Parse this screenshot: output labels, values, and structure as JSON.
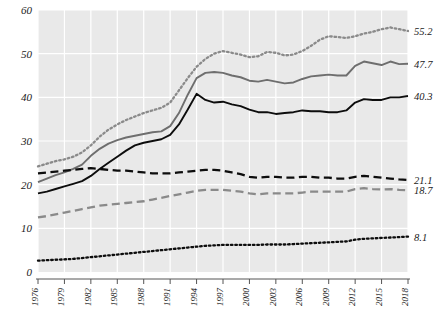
{
  "chart_data": {
    "type": "line",
    "title": "",
    "subtitle": "",
    "xlabel": "",
    "ylabel": "",
    "xlim": [
      1976,
      2018
    ],
    "ylim": [
      0,
      60
    ],
    "grid": true,
    "legend_position": "right-end-labels",
    "y_ticks": [
      0,
      10,
      20,
      30,
      40,
      50,
      60
    ],
    "y_tick_labels": [
      "0",
      "10",
      "20",
      "30",
      "40",
      "50",
      "60"
    ],
    "x_ticks": [
      1976,
      1979,
      1982,
      1985,
      1988,
      1991,
      1994,
      1997,
      2000,
      2003,
      2006,
      2009,
      2012,
      2015,
      2018
    ],
    "x_tick_labels": [
      "1976",
      "1979",
      "1982",
      "1985",
      "1988",
      "1991",
      "1994",
      "1997",
      "2000",
      "2003",
      "2006",
      "2009",
      "2012",
      "2015",
      "2018"
    ],
    "x": [
      1976,
      1977,
      1978,
      1979,
      1980,
      1981,
      1982,
      1983,
      1984,
      1985,
      1986,
      1987,
      1988,
      1989,
      1990,
      1991,
      1992,
      1993,
      1994,
      1995,
      1996,
      1997,
      1998,
      1999,
      2000,
      2001,
      2002,
      2003,
      2004,
      2005,
      2006,
      2007,
      2008,
      2009,
      2010,
      2011,
      2012,
      2013,
      2014,
      2015,
      2016,
      2017,
      2018
    ],
    "series": [
      {
        "name": "series-1",
        "style": "dotted",
        "color": "#8a8a8a",
        "end_label": "55.2",
        "end_value": 55.2,
        "values": [
          24.2,
          24.8,
          25.4,
          25.8,
          26.4,
          27.4,
          29.0,
          31.0,
          32.6,
          33.8,
          34.8,
          35.6,
          36.4,
          37.0,
          37.6,
          38.8,
          41.6,
          44.4,
          47.0,
          48.8,
          50.0,
          50.6,
          50.2,
          49.8,
          49.2,
          49.4,
          50.4,
          50.2,
          49.6,
          49.8,
          50.6,
          51.8,
          53.2,
          54.0,
          53.8,
          53.6,
          54.0,
          54.6,
          55.0,
          55.6,
          56.0,
          55.6,
          55.2
        ]
      },
      {
        "name": "series-2",
        "style": "solid",
        "color": "#6e6e6e",
        "end_label": "47.7",
        "end_value": 47.7,
        "values": [
          20.6,
          21.4,
          22.2,
          22.8,
          23.6,
          24.6,
          26.6,
          28.2,
          29.4,
          30.2,
          30.8,
          31.2,
          31.6,
          32.0,
          32.2,
          33.4,
          36.4,
          40.6,
          44.4,
          45.6,
          45.8,
          45.6,
          45.0,
          44.6,
          43.8,
          43.6,
          44.0,
          43.6,
          43.2,
          43.4,
          44.2,
          44.8,
          45.0,
          45.2,
          45.0,
          45.0,
          47.2,
          48.2,
          47.8,
          47.4,
          48.2,
          47.6,
          47.7
        ]
      },
      {
        "name": "series-3",
        "style": "solid",
        "color": "#0d0d0d",
        "end_label": "40.3",
        "end_value": 40.3,
        "values": [
          18.0,
          18.4,
          19.0,
          19.6,
          20.2,
          20.8,
          22.0,
          23.6,
          25.0,
          26.4,
          27.8,
          29.0,
          29.6,
          30.0,
          30.4,
          31.4,
          33.8,
          37.2,
          40.8,
          39.4,
          38.8,
          39.0,
          38.4,
          38.0,
          37.2,
          36.6,
          36.6,
          36.2,
          36.4,
          36.6,
          37.0,
          36.8,
          36.8,
          36.6,
          36.6,
          37.0,
          38.8,
          39.6,
          39.4,
          39.4,
          40.0,
          40.0,
          40.3
        ]
      },
      {
        "name": "series-4",
        "style": "dashed",
        "color": "#0d0d0d",
        "end_label": "21.1",
        "end_value": 21.1,
        "values": [
          22.6,
          22.8,
          23.0,
          23.2,
          23.4,
          23.6,
          23.8,
          23.6,
          23.4,
          23.2,
          23.2,
          23.0,
          22.8,
          22.6,
          22.6,
          22.6,
          22.8,
          23.0,
          23.2,
          23.4,
          23.4,
          23.2,
          22.8,
          22.4,
          21.8,
          21.6,
          21.8,
          21.8,
          21.6,
          21.6,
          21.8,
          21.8,
          21.6,
          21.6,
          21.4,
          21.4,
          21.8,
          22.0,
          21.8,
          21.6,
          21.4,
          21.2,
          21.1
        ]
      },
      {
        "name": "series-5",
        "style": "dashed",
        "color": "#8a8a8a",
        "end_label": "18.7",
        "end_value": 18.7,
        "values": [
          12.5,
          12.8,
          13.2,
          13.6,
          14.0,
          14.4,
          14.8,
          15.2,
          15.4,
          15.6,
          15.8,
          16.0,
          16.2,
          16.6,
          17.0,
          17.4,
          17.8,
          18.2,
          18.6,
          18.8,
          18.8,
          18.8,
          18.6,
          18.4,
          18.0,
          17.8,
          18.0,
          18.0,
          18.0,
          18.0,
          18.2,
          18.4,
          18.4,
          18.4,
          18.4,
          18.4,
          19.0,
          19.2,
          19.0,
          18.9,
          19.0,
          18.8,
          18.7
        ]
      },
      {
        "name": "series-6",
        "style": "dotted",
        "color": "#0d0d0d",
        "end_label": "8.1",
        "end_value": 8.1,
        "values": [
          2.6,
          2.7,
          2.8,
          2.9,
          3.0,
          3.2,
          3.4,
          3.6,
          3.8,
          4.0,
          4.2,
          4.4,
          4.6,
          4.8,
          5.0,
          5.2,
          5.4,
          5.6,
          5.8,
          6.0,
          6.1,
          6.2,
          6.2,
          6.2,
          6.2,
          6.2,
          6.3,
          6.3,
          6.3,
          6.4,
          6.5,
          6.6,
          6.7,
          6.8,
          6.9,
          7.0,
          7.4,
          7.6,
          7.7,
          7.8,
          7.9,
          8.0,
          8.1
        ]
      }
    ]
  },
  "axes": {
    "background_color": "#e9e9e9",
    "gridline_color": "#ffffff",
    "tick_color": "#555555",
    "page_background": "#ffffff"
  }
}
